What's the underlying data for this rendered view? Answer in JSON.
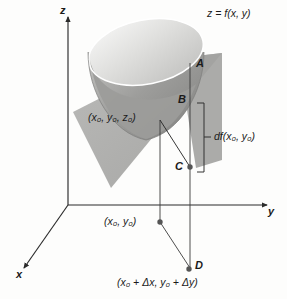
{
  "figure": {
    "kind": "3d-calculus-diagram",
    "background_color": "#fdfdfc",
    "ink_color": "#1a1a1a"
  },
  "axes": {
    "x_label": "x",
    "y_label": "y",
    "z_label": "z",
    "origin": {
      "x": 68,
      "y": 205
    }
  },
  "surface": {
    "equation_label": "z = f(x, y)",
    "outer_fill": "#9a9a9a",
    "inner_fill": "#e3e3e1",
    "rim_stroke": "#ffffff"
  },
  "tangent_plane": {
    "fill": "#a8a8a8",
    "opacity": 0.85
  },
  "points": [
    {
      "id": "A",
      "label": "A",
      "x": 199,
      "y": 64
    },
    {
      "id": "B",
      "label": "B",
      "x": 181,
      "y": 100
    },
    {
      "id": "C",
      "label": "C",
      "x": 178,
      "y": 168
    },
    {
      "id": "D",
      "label": "D",
      "x": 197,
      "y": 267
    }
  ],
  "annotations": {
    "tangent_point": "(x₀, y₀, z₀)",
    "base_point": "(x₀, y₀)",
    "offset_point": "(x₀ + Δx, y₀ + Δy)",
    "differential": "df(x₀, y₀)"
  },
  "bracket": {
    "label": "df(x₀, y₀)",
    "top_y": 103,
    "bottom_y": 172,
    "x": 205
  },
  "colors": {
    "line": "#2b2b2b",
    "dot": "#555555",
    "plane_gray": "#a8a8a8",
    "bowl_dark": "#9a9a9a",
    "bowl_light": "#e6e6e4"
  }
}
